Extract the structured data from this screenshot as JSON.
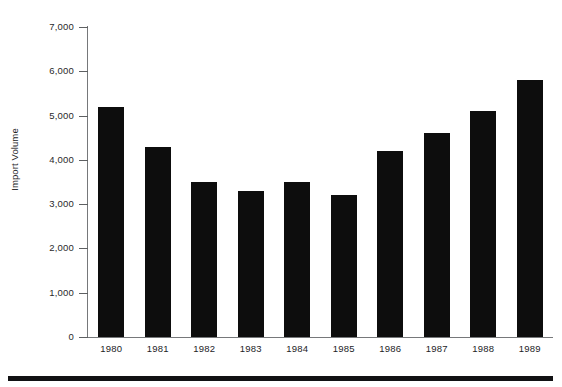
{
  "chart_data": {
    "type": "bar",
    "title": "",
    "subtitle": "",
    "xlabel": "",
    "ylabel": "Import Volume",
    "categories": [
      "1980",
      "1981",
      "1982",
      "1983",
      "1984",
      "1985",
      "1986",
      "1987",
      "1988",
      "1989"
    ],
    "values": [
      5200,
      4300,
      3500,
      3300,
      3500,
      3200,
      4200,
      4600,
      5100,
      5800
    ],
    "series": [
      {
        "name": "Import Volume",
        "values": [
          5200,
          4300,
          3500,
          3300,
          3500,
          3200,
          4200,
          4600,
          5100,
          5800
        ]
      }
    ],
    "ylim": [
      0,
      7000
    ],
    "ytick_values": [
      0,
      1000,
      2000,
      3000,
      4000,
      5000,
      6000,
      7000
    ],
    "ytick_labels": [
      "0",
      "1,000",
      "2,000",
      "3,000",
      "4,000",
      "5,000",
      "6,000",
      "7,000"
    ],
    "grid": false,
    "legend": false,
    "legend_position": "none",
    "bar_color": "#0d0d0d",
    "axis_color": "#76787a",
    "background_color": "#ffffff"
  },
  "figure": {
    "y_axis_title": "Import Volume",
    "footer_rule_color": "#111113"
  }
}
